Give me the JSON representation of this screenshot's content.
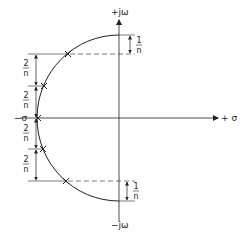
{
  "diagram": {
    "type": "s-plane pole locations on semicircle",
    "axes": {
      "imag_pos_label": "+jω",
      "imag_neg_label": "−jω",
      "real_pos_label": "+ σ",
      "real_neg_label": "−σ"
    },
    "dimension_labels": {
      "left_spacing": {
        "num": "2",
        "den": "n"
      },
      "edge_spacing": {
        "num": "1",
        "den": "n"
      }
    },
    "poles_count": 5,
    "colors": {
      "ink": "#222222",
      "background": "#ffffff"
    }
  }
}
